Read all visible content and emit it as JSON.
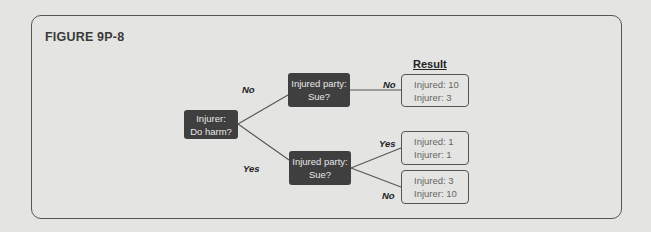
{
  "figure": {
    "title": "FIGURE 9P-8",
    "result_header": "Result"
  },
  "nodes": {
    "root": {
      "line1": "Injurer:",
      "line2": "Do harm?"
    },
    "top": {
      "line1": "Injured party:",
      "line2": "Sue?"
    },
    "bottom": {
      "line1": "Injured party:",
      "line2": "Sue?"
    }
  },
  "edge_labels": {
    "root_to_top": "No",
    "root_to_bottom": "Yes",
    "top_to_result1": "No",
    "bottom_to_result2": "Yes",
    "bottom_to_result3": "No"
  },
  "results": [
    {
      "injured": "Injured: 10",
      "injurer": "Injurer: 3"
    },
    {
      "injured": "Injured: 1",
      "injurer": "Injurer: 1"
    },
    {
      "injured": "Injured: 3",
      "injurer": "Injurer: 10"
    }
  ],
  "colors": {
    "background": "#e4e4e2",
    "node_fill": "#3f3f3f",
    "line": "#555555"
  }
}
